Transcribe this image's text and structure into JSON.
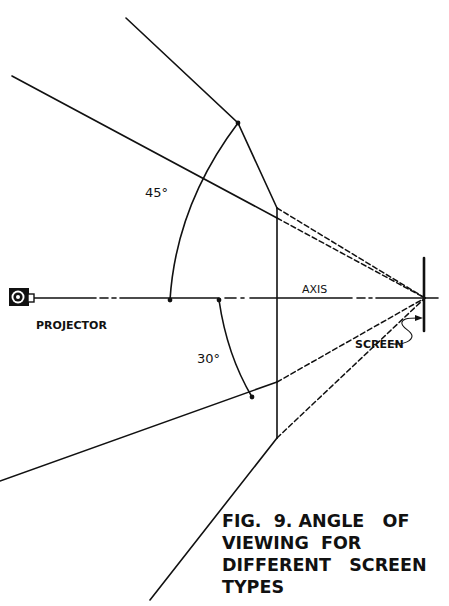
{
  "figure": {
    "caption_lines": [
      "FIG.  9. ANGLE   OF",
      "VIEWING  FOR",
      "DIFFERENT   SCREEN",
      "TYPES"
    ],
    "labels": {
      "angle_wide": "45°",
      "angle_narrow": "30°",
      "axis": "AXIS",
      "projector": "PROJECTOR",
      "screen": "SCREEN"
    },
    "icons": {
      "projector": "projector-icon"
    },
    "colors": {
      "ink": "#111111",
      "background": "#ffffff"
    }
  }
}
